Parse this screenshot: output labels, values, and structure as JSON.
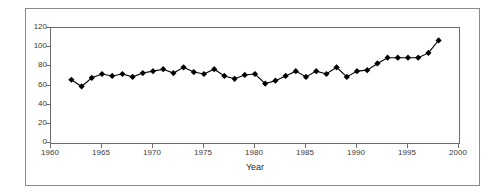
{
  "chart_data": {
    "type": "line",
    "title": "",
    "subtitle": "",
    "xlabel": "Year",
    "ylabel": "",
    "xlim": [
      1960,
      2000
    ],
    "ylim": [
      0,
      120
    ],
    "xticks": [
      1960,
      1965,
      1970,
      1975,
      1980,
      1985,
      1990,
      1995,
      2000
    ],
    "yticks": [
      0,
      20,
      40,
      60,
      80,
      100,
      120
    ],
    "grid": false,
    "legend": null,
    "marker": "filled-diamond",
    "marker_color": "#000000",
    "line_color": "#000000",
    "x": [
      1962,
      1963,
      1964,
      1965,
      1966,
      1967,
      1968,
      1969,
      1970,
      1971,
      1972,
      1973,
      1974,
      1975,
      1976,
      1977,
      1978,
      1979,
      1980,
      1981,
      1982,
      1983,
      1984,
      1985,
      1986,
      1987,
      1988,
      1989,
      1990,
      1991,
      1992,
      1993,
      1994,
      1995,
      1996,
      1997,
      1998
    ],
    "values": [
      66,
      59,
      68,
      72,
      70,
      72,
      69,
      73,
      75,
      77,
      73,
      79,
      74,
      72,
      77,
      70,
      67,
      71,
      72,
      62,
      65,
      70,
      75,
      69,
      75,
      72,
      79,
      69,
      75,
      76,
      83,
      89,
      89,
      89,
      89,
      94,
      107
    ],
    "series": [
      {
        "name": "series-1",
        "values": [
          66,
          59,
          68,
          72,
          70,
          72,
          69,
          73,
          75,
          77,
          73,
          79,
          74,
          72,
          77,
          70,
          67,
          71,
          72,
          62,
          65,
          70,
          75,
          69,
          75,
          76,
          79,
          69,
          75,
          76,
          83,
          89,
          89,
          89,
          89,
          94,
          107
        ]
      }
    ]
  },
  "axes": {
    "y_tick_labels": [
      "120",
      "100",
      "80",
      "60",
      "40",
      "20",
      "0"
    ],
    "x_tick_labels": [
      "1960",
      "1965",
      "1970",
      "1975",
      "1980",
      "1985",
      "1990",
      "1995",
      "2000"
    ],
    "x_title": "Year"
  }
}
